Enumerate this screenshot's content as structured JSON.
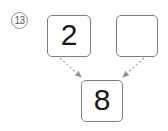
{
  "figure": {
    "marker_label": "13",
    "marker_icon": "circled-number-icon",
    "arrow_style": "dashed",
    "arrow_color": "#9a9a9a",
    "box_border_color": "#7d7d7d",
    "digit_color": "#1a1a1a",
    "background_color": "#ffffff"
  },
  "cells": {
    "addend_left": {
      "name": "addend-left",
      "value": "2"
    },
    "addend_right": {
      "name": "addend-right",
      "value": ""
    },
    "sum": {
      "name": "sum",
      "value": "8"
    }
  },
  "arrows": [
    {
      "name": "arrow-left-to-sum",
      "from": "addend-left",
      "to": "sum"
    },
    {
      "name": "arrow-right-to-sum",
      "from": "addend-right",
      "to": "sum"
    }
  ]
}
